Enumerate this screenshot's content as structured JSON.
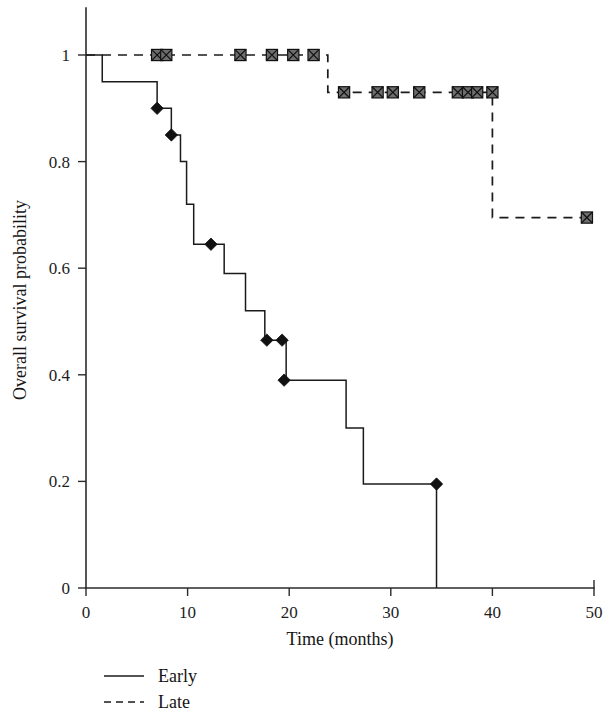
{
  "figure": {
    "background": "#ffffff",
    "ink_color": "#1b1b1b"
  },
  "chart_data": {
    "type": "line",
    "subtype": "kaplan-meier-step",
    "title": "",
    "xlabel": "Time (months)",
    "ylabel": "Overall survival probability",
    "xlim": [
      0,
      50
    ],
    "ylim": [
      0,
      1
    ],
    "xticks": [
      0,
      10,
      20,
      30,
      40,
      50
    ],
    "xtick_labels": [
      "0",
      "10",
      "20",
      "30",
      "40",
      "50"
    ],
    "yticks": [
      0,
      0.2,
      0.4,
      0.6,
      0.8,
      1
    ],
    "ytick_labels": [
      "0",
      "0.2",
      "0.4",
      "0.6",
      "0.8",
      "1"
    ],
    "grid": false,
    "legend_position": "below-left",
    "series": [
      {
        "name": "Early",
        "line_style": "solid",
        "marker": "filled-diamond",
        "steps": [
          {
            "t": 0.0,
            "s": 1.0
          },
          {
            "t": 1.6,
            "s": 0.95
          },
          {
            "t": 7.0,
            "s": 0.9
          },
          {
            "t": 8.4,
            "s": 0.85
          },
          {
            "t": 9.3,
            "s": 0.8
          },
          {
            "t": 9.9,
            "s": 0.72
          },
          {
            "t": 10.6,
            "s": 0.645
          },
          {
            "t": 13.6,
            "s": 0.59
          },
          {
            "t": 15.7,
            "s": 0.52
          },
          {
            "t": 17.6,
            "s": 0.465
          },
          {
            "t": 19.7,
            "s": 0.39
          },
          {
            "t": 25.6,
            "s": 0.3
          },
          {
            "t": 27.3,
            "s": 0.195
          },
          {
            "t": 34.5,
            "s": 0.0
          }
        ],
        "event_points": [
          {
            "t": 7.0,
            "s": 0.9
          },
          {
            "t": 8.4,
            "s": 0.85
          },
          {
            "t": 12.3,
            "s": 0.645
          },
          {
            "t": 17.8,
            "s": 0.465
          },
          {
            "t": 19.3,
            "s": 0.465
          },
          {
            "t": 19.5,
            "s": 0.39
          },
          {
            "t": 34.5,
            "s": 0.195
          }
        ],
        "censor_points": []
      },
      {
        "name": "Late",
        "line_style": "dashed",
        "marker": "crossed-square",
        "steps": [
          {
            "t": 0.0,
            "s": 1.0
          },
          {
            "t": 23.8,
            "s": 0.93
          },
          {
            "t": 40.0,
            "s": 0.695
          },
          {
            "t": 49.3,
            "s": 0.695
          }
        ],
        "event_points": [],
        "censor_points": [
          {
            "t": 7.0,
            "s": 1.0
          },
          {
            "t": 7.9,
            "s": 1.0
          },
          {
            "t": 15.2,
            "s": 1.0
          },
          {
            "t": 18.3,
            "s": 1.0
          },
          {
            "t": 20.4,
            "s": 1.0
          },
          {
            "t": 22.4,
            "s": 1.0
          },
          {
            "t": 25.4,
            "s": 0.93
          },
          {
            "t": 28.7,
            "s": 0.93
          },
          {
            "t": 30.2,
            "s": 0.93
          },
          {
            "t": 32.8,
            "s": 0.93
          },
          {
            "t": 36.6,
            "s": 0.93
          },
          {
            "t": 37.6,
            "s": 0.93
          },
          {
            "t": 38.5,
            "s": 0.93
          },
          {
            "t": 40.0,
            "s": 0.93
          },
          {
            "t": 49.3,
            "s": 0.695
          }
        ]
      }
    ]
  },
  "legend": {
    "items": [
      {
        "label": "Early",
        "style": "solid"
      },
      {
        "label": "Late",
        "style": "dashed"
      }
    ]
  }
}
